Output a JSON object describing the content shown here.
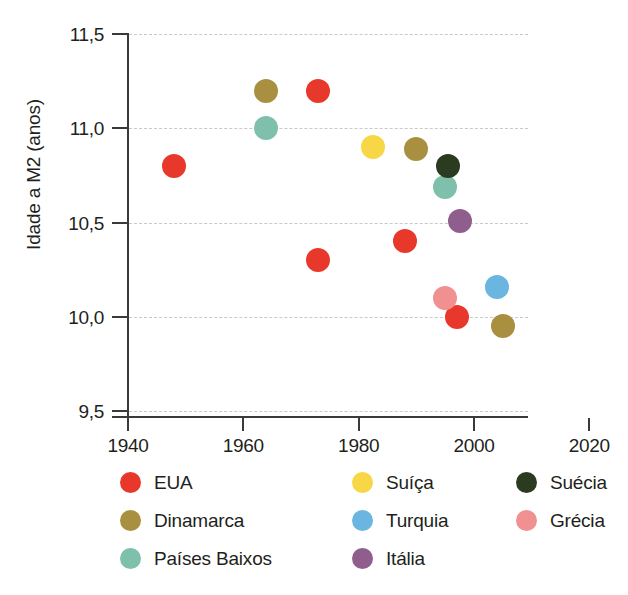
{
  "chart_data": {
    "type": "scatter",
    "title": "",
    "xlabel": "",
    "ylabel": "Idade a M2 (anos)",
    "xlim": [
      1935,
      2023
    ],
    "ylim": [
      9.5,
      11.5
    ],
    "xticks": [
      "1940",
      "1960",
      "1980",
      "2000",
      "2020"
    ],
    "xtick_values": [
      1940,
      1960,
      1980,
      2000,
      2020
    ],
    "yticks": [
      "11,5",
      "11,0",
      "10,5",
      "10,0",
      "9,5"
    ],
    "ytick_values": [
      11.5,
      11.0,
      10.5,
      10.0,
      9.5
    ],
    "grid": "horizontal-dashed",
    "legend_position": "below",
    "series": [
      {
        "name": "EUA",
        "color": "#E8382C",
        "points": [
          {
            "x": 1948,
            "y": 10.8
          },
          {
            "x": 1973,
            "y": 11.2
          },
          {
            "x": 1973,
            "y": 10.3
          },
          {
            "x": 1988,
            "y": 10.4
          },
          {
            "x": 1997,
            "y": 10.0
          }
        ]
      },
      {
        "name": "Dinamarca",
        "color": "#A89040",
        "points": [
          {
            "x": 1964,
            "y": 11.2
          },
          {
            "x": 1990,
            "y": 10.89
          },
          {
            "x": 2005,
            "y": 9.95
          }
        ]
      },
      {
        "name": "Países Baixos",
        "color": "#7FC0AC",
        "points": [
          {
            "x": 1964,
            "y": 11.0
          },
          {
            "x": 1995,
            "y": 10.69
          }
        ]
      },
      {
        "name": "Suíça",
        "color": "#F7D745",
        "points": [
          {
            "x": 1982.5,
            "y": 10.9
          }
        ]
      },
      {
        "name": "Turquia",
        "color": "#6AB6E0",
        "points": [
          {
            "x": 2004,
            "y": 10.16
          }
        ]
      },
      {
        "name": "Itália",
        "color": "#8F5E8C",
        "points": [
          {
            "x": 1997.5,
            "y": 10.51
          }
        ]
      },
      {
        "name": "Suécia",
        "color": "#2B3B20",
        "points": [
          {
            "x": 1995.5,
            "y": 10.8
          }
        ]
      },
      {
        "name": "Grécia",
        "color": "#F09090",
        "points": [
          {
            "x": 1995,
            "y": 10.1
          }
        ]
      }
    ]
  },
  "legend": {
    "items": [
      {
        "label": "EUA",
        "color": "#E8382C",
        "col": 0,
        "row": 0
      },
      {
        "label": "Dinamarca",
        "color": "#A89040",
        "col": 0,
        "row": 1
      },
      {
        "label": "Países Baixos",
        "color": "#7FC0AC",
        "col": 0,
        "row": 2
      },
      {
        "label": "Suíça",
        "color": "#F7D745",
        "col": 1,
        "row": 0
      },
      {
        "label": "Turquia",
        "color": "#6AB6E0",
        "col": 1,
        "row": 1
      },
      {
        "label": "Itália",
        "color": "#8F5E8C",
        "col": 1,
        "row": 2
      },
      {
        "label": "Suécia",
        "color": "#2B3B20",
        "col": 2,
        "row": 0
      },
      {
        "label": "Grécia",
        "color": "#F09090",
        "col": 2,
        "row": 1
      }
    ]
  }
}
